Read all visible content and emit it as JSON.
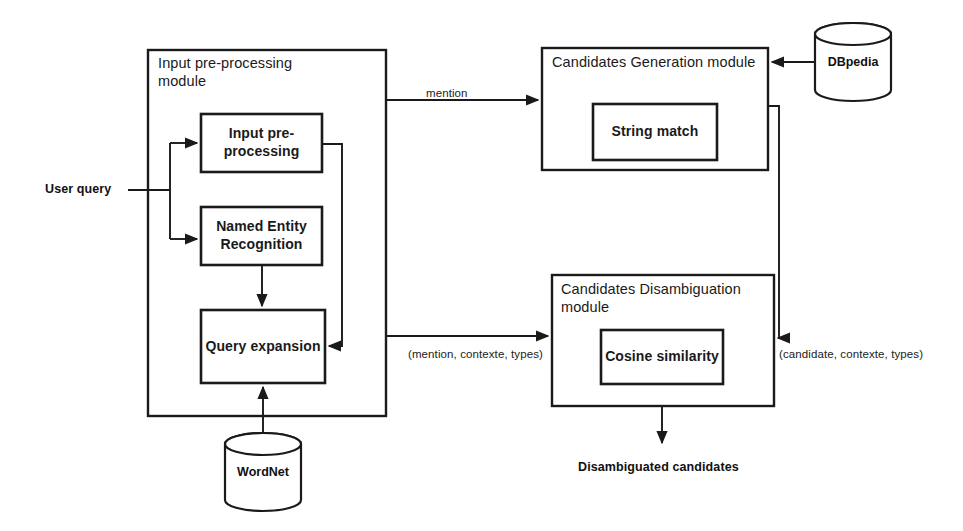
{
  "diagram": {
    "background_color": "#ffffff",
    "stroke_color": "#1a1a1a",
    "text_color": "#1a1a1a"
  },
  "modules": [
    {
      "id": "input-preprocessing-module",
      "caption": "Input pre-processing\nmodule",
      "x": 148,
      "y": 50,
      "w": 238,
      "h": 366
    },
    {
      "id": "candidates-generation-module",
      "caption": "Candidates Generation module",
      "x": 542,
      "y": 48,
      "w": 226,
      "h": 122
    },
    {
      "id": "candidates-disambiguation-module",
      "caption": "Candidates Disambiguation\nmodule",
      "x": 552,
      "y": 275,
      "w": 222,
      "h": 131
    }
  ],
  "processes": [
    {
      "id": "input-pre-processing",
      "label": "Input pre-\nprocessing",
      "x": 201,
      "y": 114,
      "w": 121,
      "h": 58
    },
    {
      "id": "named-entity-recognition",
      "label": "Named Entity\nRecognition",
      "x": 201,
      "y": 207,
      "w": 121,
      "h": 58
    },
    {
      "id": "query-expansion",
      "label": "Query expansion",
      "x": 201,
      "y": 310,
      "w": 124,
      "h": 73
    },
    {
      "id": "string-match",
      "label": "String match",
      "x": 593,
      "y": 104,
      "w": 124,
      "h": 56
    },
    {
      "id": "cosine-similarity",
      "label": "Cosine similarity",
      "x": 601,
      "y": 330,
      "w": 122,
      "h": 54
    }
  ],
  "datastores": [
    {
      "id": "dbpedia",
      "label": "DBpedia",
      "cx": 853,
      "cy": 62,
      "rx": 38,
      "ry": 11,
      "body_h": 56
    },
    {
      "id": "wordnet",
      "label": "WordNet",
      "cx": 263,
      "cy": 455,
      "rx": 38,
      "ry": 11,
      "body_h": 56
    }
  ],
  "edge_labels": [
    {
      "id": "mention-label",
      "text": "mention",
      "x": 426,
      "y": 86
    },
    {
      "id": "mention-context-types-label",
      "text": "(mention, contexte, types)",
      "x": 408,
      "y": 347
    },
    {
      "id": "candidate-context-types-label",
      "text": "(candidate, contexte, types)",
      "x": 779,
      "y": 347
    }
  ],
  "external_labels": [
    {
      "id": "user-query-label",
      "text": "User query",
      "x": 45,
      "y": 182
    },
    {
      "id": "disambiguated-candidates-label",
      "text": "Disambiguated candidates",
      "x": 578,
      "y": 460
    }
  ]
}
